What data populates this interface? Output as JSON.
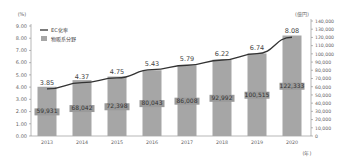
{
  "chart_data": {
    "type": "bar+line",
    "title": "",
    "categories": [
      "2013",
      "2014",
      "2015",
      "2016",
      "2017",
      "2018",
      "2019",
      "2020"
    ],
    "series": [
      {
        "name": "物販系分野",
        "type": "bar",
        "axis": "right",
        "values": [
          59931,
          68042,
          72398,
          80043,
          86008,
          92992,
          100515,
          122333
        ],
        "labels": [
          "59,931",
          "68,042",
          "72,398",
          "80,043",
          "86,008",
          "92,992",
          "100,515",
          "122,333"
        ],
        "color": "#a6a6a6"
      },
      {
        "name": "EC化率",
        "type": "line",
        "axis": "left",
        "values": [
          3.85,
          4.37,
          4.75,
          5.43,
          5.79,
          6.22,
          6.74,
          8.08
        ],
        "labels": [
          "3.85",
          "4.37",
          "4.75",
          "5.43",
          "5.79",
          "6.22",
          "6.74",
          "8.08"
        ],
        "color": "#333333"
      }
    ],
    "left_axis": {
      "unit": "(%)",
      "ylim": [
        0,
        9
      ],
      "ticks": [
        "0.00",
        "1.00",
        "2.00",
        "3.00",
        "4.00",
        "5.00",
        "6.00",
        "7.00",
        "8.00",
        "9.00"
      ]
    },
    "right_axis": {
      "unit": "(億円)",
      "ylim": [
        0,
        140000
      ],
      "ticks": [
        "0",
        "10,000",
        "20,000",
        "30,000",
        "40,000",
        "50,000",
        "60,000",
        "70,000",
        "80,000",
        "90,000",
        "100,000",
        "110,000",
        "120,000",
        "130,000",
        "140,000"
      ]
    },
    "xlabel_unit": "(年)",
    "legend": [
      {
        "label": "EC化率",
        "kind": "line"
      },
      {
        "label": "物販系分野",
        "kind": "bar"
      }
    ],
    "legend_position": "top-left",
    "grid": false
  }
}
